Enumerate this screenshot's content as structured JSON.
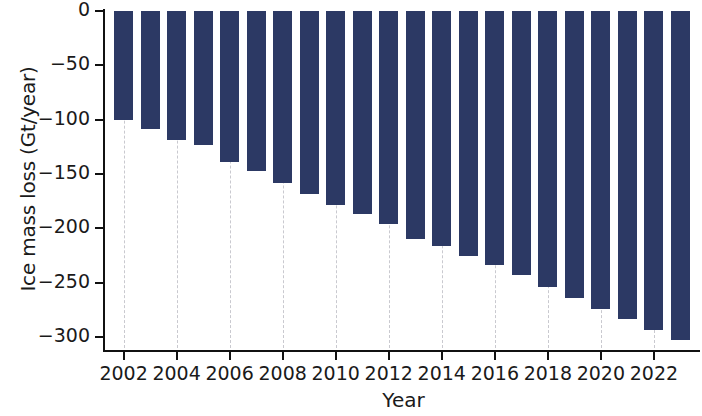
{
  "chart_data": {
    "type": "bar",
    "title": "",
    "xlabel": "Year",
    "ylabel": "Ice mass loss (Gt/year)",
    "grid": true,
    "legend": "none",
    "bar_color": "#2c3964",
    "background_color": "#ffffff",
    "axis_color": "#111111",
    "grid_color": "#c9c9cf",
    "xlim": [
      2001.3,
      2023.7
    ],
    "ylim": [
      -310,
      0
    ],
    "xticks": [
      2002,
      2004,
      2006,
      2008,
      2010,
      2012,
      2014,
      2016,
      2018,
      2020,
      2022
    ],
    "xtick_labels": [
      "2002",
      "2004",
      "2006",
      "2008",
      "2010",
      "2012",
      "2014",
      "2016",
      "2018",
      "2020",
      "2022"
    ],
    "yticks": [
      0,
      -50,
      -100,
      -150,
      -200,
      -250,
      -300
    ],
    "ytick_labels": [
      "0",
      "−50",
      "−100",
      "−150",
      "−200",
      "−250",
      "−300"
    ],
    "categories": [
      2002,
      2003,
      2004,
      2005,
      2006,
      2007,
      2008,
      2009,
      2010,
      2011,
      2012,
      2013,
      2014,
      2015,
      2016,
      2017,
      2018,
      2019,
      2020,
      2021,
      2022,
      2023
    ],
    "values": [
      -100,
      -109,
      -119,
      -123,
      -139,
      -147,
      -158,
      -168,
      -178,
      -187,
      -196,
      -210,
      -216,
      -225,
      -234,
      -243,
      -254,
      -264,
      -274,
      -283,
      -293,
      -303
    ]
  }
}
